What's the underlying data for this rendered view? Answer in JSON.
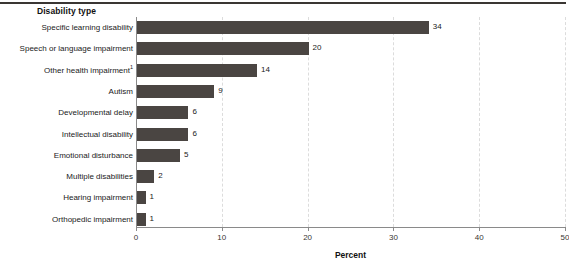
{
  "header": {
    "column_title": "Disability type"
  },
  "chart_data": {
    "type": "bar",
    "orientation": "horizontal",
    "title": "",
    "xlabel": "Percent",
    "ylabel": "Disability type",
    "xlim": [
      0,
      50
    ],
    "xticks": [
      0,
      10,
      20,
      30,
      40,
      50
    ],
    "xtick_labels": [
      "0",
      "10",
      "20",
      "30",
      "40",
      "50"
    ],
    "grid": "vertical-dashed",
    "legend": "none",
    "bar_color": "#4a4542",
    "categories": [
      "Specific learning disability",
      "Speech or language impairment",
      "Other health impairment",
      "Autism",
      "Developmental delay",
      "Intellectual disability",
      "Emotional disturbance",
      "Multiple disabilities",
      "Hearing impairment",
      "Orthopedic impairment"
    ],
    "category_footnotes": [
      "",
      "",
      "1",
      "",
      "",
      "",
      "",
      "",
      "",
      ""
    ],
    "values": [
      34,
      20,
      14,
      9,
      6,
      6,
      5,
      2,
      1,
      1
    ],
    "value_labels": [
      "34",
      "20",
      "14",
      "9",
      "6",
      "6",
      "5",
      "2",
      "1",
      "1"
    ]
  }
}
